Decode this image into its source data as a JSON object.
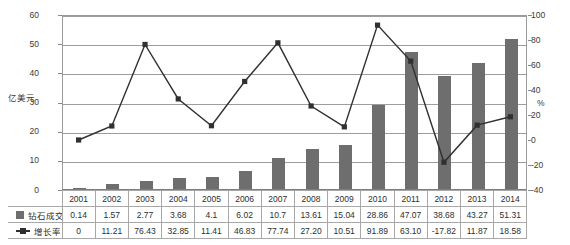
{
  "axes": {
    "left_title": "亿美元",
    "right_title": "%",
    "left_ticks": [
      "0",
      "10",
      "20",
      "30",
      "40",
      "50",
      "60"
    ],
    "right_ticks": [
      "-40",
      "-20",
      "0",
      "20",
      "40",
      "60",
      "80",
      "100"
    ]
  },
  "legend": {
    "bar_label": "钻石成交额",
    "line_label": "增长率",
    "bar_icon": "square-swatch-icon",
    "line_icon": "line-marker-icon"
  },
  "table": {
    "years": [
      "2001",
      "2002",
      "2003",
      "2004",
      "2005",
      "2006",
      "2007",
      "2008",
      "2009",
      "2010",
      "2011",
      "2012",
      "2013",
      "2014"
    ],
    "row_bar": [
      "0.14",
      "1.57",
      "2.77",
      "3.68",
      "4.1",
      "6.02",
      "10.7",
      "13.61",
      "15.04",
      "28.86",
      "47.07",
      "38.68",
      "43.27",
      "51.31"
    ],
    "row_line": [
      "0",
      "11.21",
      "76.43",
      "32.85",
      "11.41",
      "46.83",
      "77.74",
      "27.20",
      "10.51",
      "91.89",
      "63.10",
      "-17.82",
      "11.87",
      "18.58"
    ]
  },
  "colors": {
    "bar": "#6e6e6e",
    "line": "#303030",
    "grid": "#9d9d9d",
    "axis": "#9a9a9a"
  },
  "chart_data": {
    "type": "bar",
    "title": "",
    "xlabel": "",
    "ylabel": "亿美元",
    "y2label": "%",
    "categories": [
      "2001",
      "2002",
      "2003",
      "2004",
      "2005",
      "2006",
      "2007",
      "2008",
      "2009",
      "2010",
      "2011",
      "2012",
      "2013",
      "2014"
    ],
    "ylim": [
      0,
      60
    ],
    "y2lim": [
      -40,
      100
    ],
    "yticks": [
      0,
      10,
      20,
      30,
      40,
      50,
      60
    ],
    "y2ticks": [
      -40,
      -20,
      0,
      20,
      40,
      60,
      80,
      100
    ],
    "grid": true,
    "legend_position": "table-below",
    "series": [
      {
        "name": "钻石成交额",
        "type": "bar",
        "axis": "left",
        "unit": "亿美元",
        "values": [
          0.14,
          1.57,
          2.77,
          3.68,
          4.1,
          6.02,
          10.7,
          13.61,
          15.04,
          28.86,
          47.07,
          38.68,
          43.27,
          51.31
        ]
      },
      {
        "name": "增长率",
        "type": "line",
        "axis": "right",
        "unit": "%",
        "values": [
          0,
          11.21,
          76.43,
          32.85,
          11.41,
          46.83,
          77.74,
          27.2,
          10.51,
          91.89,
          63.1,
          -17.82,
          11.87,
          18.58
        ]
      }
    ]
  }
}
